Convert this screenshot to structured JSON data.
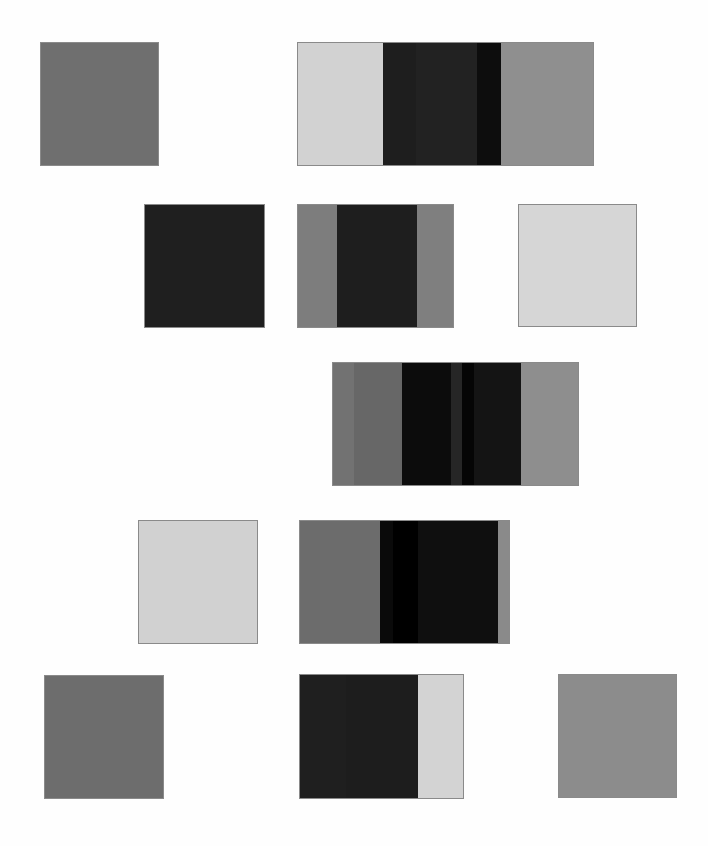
{
  "canvas": {
    "width": 708,
    "height": 846,
    "background": "#fefefe"
  },
  "swatches": [
    {
      "name": "swatch-row1-left",
      "x": 40,
      "y": 42,
      "w": 119,
      "h": 124,
      "bands": [
        {
          "w": 119,
          "color": "#6f6f6f"
        }
      ]
    },
    {
      "name": "swatch-row1-right",
      "x": 297,
      "y": 42,
      "w": 297,
      "h": 124,
      "bands": [
        {
          "w": 85,
          "color": "#d2d2d2"
        },
        {
          "w": 33,
          "color": "#1e1e1e"
        },
        {
          "w": 61,
          "color": "#222222"
        },
        {
          "w": 24,
          "color": "#0d0d0d"
        },
        {
          "w": 94,
          "color": "#8f8f8f"
        }
      ]
    },
    {
      "name": "swatch-row2-left",
      "x": 144,
      "y": 204,
      "w": 121,
      "h": 124,
      "bands": [
        {
          "w": 121,
          "color": "#1f1f1f"
        }
      ]
    },
    {
      "name": "swatch-row2-middle",
      "x": 297,
      "y": 204,
      "w": 157,
      "h": 124,
      "bands": [
        {
          "w": 39,
          "color": "#7d7d7d"
        },
        {
          "w": 80,
          "color": "#1e1e1e"
        },
        {
          "w": 38,
          "color": "#7f7f7f"
        }
      ]
    },
    {
      "name": "swatch-row2-right",
      "x": 518,
      "y": 204,
      "w": 119,
      "h": 123,
      "bands": [
        {
          "w": 119,
          "color": "#d6d6d6"
        }
      ]
    },
    {
      "name": "swatch-row3-center",
      "x": 332,
      "y": 362,
      "w": 247,
      "h": 124,
      "bands": [
        {
          "w": 21,
          "color": "#727272"
        },
        {
          "w": 48,
          "color": "#676767"
        },
        {
          "w": 49,
          "color": "#0c0c0c"
        },
        {
          "w": 11,
          "color": "#262626"
        },
        {
          "w": 12,
          "color": "#050505"
        },
        {
          "w": 47,
          "color": "#141414"
        },
        {
          "w": 59,
          "color": "#8e8e8e"
        }
      ]
    },
    {
      "name": "swatch-row4-left",
      "x": 138,
      "y": 520,
      "w": 120,
      "h": 124,
      "bands": [
        {
          "w": 120,
          "color": "#d1d1d1"
        }
      ]
    },
    {
      "name": "swatch-row4-right",
      "x": 299,
      "y": 520,
      "w": 211,
      "h": 124,
      "bands": [
        {
          "w": 80,
          "color": "#6c6c6c"
        },
        {
          "w": 13,
          "color": "#0a0a0a"
        },
        {
          "w": 25,
          "color": "#000000"
        },
        {
          "w": 80,
          "color": "#0f0f0f"
        },
        {
          "w": 13,
          "color": "#8a8a8a"
        }
      ]
    },
    {
      "name": "swatch-row5-left",
      "x": 44,
      "y": 675,
      "w": 120,
      "h": 124,
      "bands": [
        {
          "w": 120,
          "color": "#6d6d6d"
        }
      ]
    },
    {
      "name": "swatch-row5-middle",
      "x": 299,
      "y": 674,
      "w": 165,
      "h": 125,
      "bands": [
        {
          "w": 46,
          "color": "#1f1f1f"
        },
        {
          "w": 72,
          "color": "#1d1d1d"
        },
        {
          "w": 47,
          "color": "#d3d3d3"
        }
      ]
    },
    {
      "name": "swatch-row5-right",
      "x": 558,
      "y": 674,
      "w": 119,
      "h": 124,
      "bands": [
        {
          "w": 119,
          "color": "#8c8c8c"
        }
      ]
    }
  ]
}
